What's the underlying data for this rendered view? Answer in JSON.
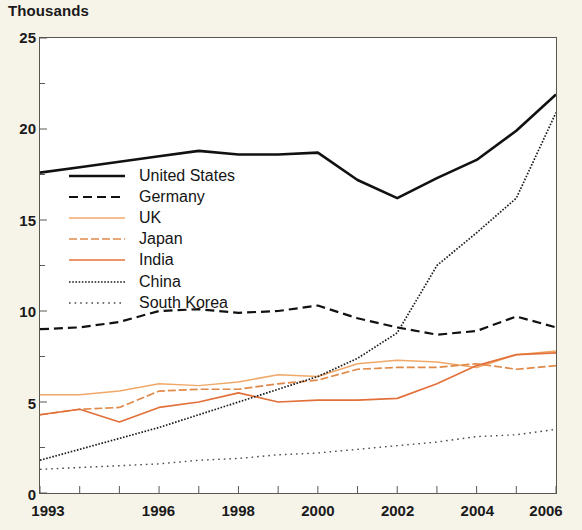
{
  "figure": {
    "unit_label": "Thousands",
    "background_color": "#f6f3e9",
    "plot_background_color": "#ffffff",
    "axis_color": "#58564e"
  },
  "legend": {
    "position": "inside-upper-left",
    "entries": [
      {
        "label": "United States",
        "color": "#111111",
        "style": "solid",
        "width": 2.6
      },
      {
        "label": "Germany",
        "color": "#111111",
        "style": "dashed",
        "width": 2.2
      },
      {
        "label": "UK",
        "color": "#f0a868",
        "style": "solid",
        "width": 1.5
      },
      {
        "label": "Japan",
        "color": "#e08a4a",
        "style": "dashdot",
        "width": 1.7
      },
      {
        "label": "India",
        "color": "#e2703a",
        "style": "solid",
        "width": 1.7
      },
      {
        "label": "China",
        "color": "#1c1c1c",
        "style": "dotted-fine",
        "width": 1.7
      },
      {
        "label": "South Korea",
        "color": "#4a4a4a",
        "style": "dotted-sparse",
        "width": 1.4
      }
    ]
  },
  "chart_data": {
    "type": "line",
    "title": "",
    "subtitle": "",
    "xlabel": "",
    "ylabel": "Thousands",
    "xlim": [
      1993,
      2006
    ],
    "ylim": [
      0,
      25
    ],
    "grid": false,
    "x": [
      1993,
      1994,
      1995,
      1996,
      1997,
      1998,
      1999,
      2000,
      2001,
      2002,
      2003,
      2004,
      2005,
      2006
    ],
    "x_tick_labels": [
      "1993",
      "1996",
      "1998",
      "2000",
      "2002",
      "2004",
      "2006"
    ],
    "x_tick_values": [
      1993,
      1996,
      1998,
      2000,
      2002,
      2004,
      2006
    ],
    "y_tick_labels": [
      "0",
      "5",
      "10",
      "15",
      "20",
      "25"
    ],
    "y_tick_values": [
      0,
      5,
      10,
      15,
      20,
      25
    ],
    "y_minor_tick_values": [
      2.5,
      7.5,
      12.5,
      17.5,
      22.5
    ],
    "series": [
      {
        "name": "United States",
        "color": "#111111",
        "style": "solid",
        "width": 2.6,
        "values": [
          17.6,
          17.9,
          18.2,
          18.5,
          18.8,
          18.6,
          18.6,
          18.7,
          17.2,
          16.2,
          17.3,
          18.3,
          19.9,
          21.9
        ]
      },
      {
        "name": "Germany",
        "color": "#111111",
        "style": "dashed",
        "width": 2.2,
        "values": [
          9.0,
          9.1,
          9.4,
          10.0,
          10.1,
          9.9,
          10.0,
          10.3,
          9.6,
          9.1,
          8.7,
          8.9,
          9.7,
          9.1
        ]
      },
      {
        "name": "UK",
        "color": "#f0a868",
        "style": "solid",
        "width": 1.5,
        "values": [
          5.4,
          5.4,
          5.6,
          6.0,
          5.9,
          6.1,
          6.5,
          6.4,
          7.1,
          7.3,
          7.2,
          6.9,
          7.6,
          7.8
        ]
      },
      {
        "name": "Japan",
        "color": "#e08a4a",
        "style": "dashdot",
        "width": 1.7,
        "values": [
          4.3,
          4.6,
          4.7,
          5.6,
          5.7,
          5.7,
          6.0,
          6.2,
          6.8,
          6.9,
          6.9,
          7.1,
          6.8,
          7.0
        ]
      },
      {
        "name": "India",
        "color": "#e2703a",
        "style": "solid",
        "width": 1.7,
        "values": [
          4.3,
          4.6,
          3.9,
          4.7,
          5.0,
          5.5,
          5.0,
          5.1,
          5.1,
          5.2,
          6.0,
          7.0,
          7.6,
          7.7
        ]
      },
      {
        "name": "China",
        "color": "#1c1c1c",
        "style": "dotted-fine",
        "width": 1.7,
        "values": [
          1.8,
          2.4,
          3.0,
          3.6,
          4.3,
          5.0,
          5.7,
          6.4,
          7.4,
          8.8,
          12.5,
          14.3,
          16.2,
          20.9
        ]
      },
      {
        "name": "South Korea",
        "color": "#4a4a4a",
        "style": "dotted-sparse",
        "width": 1.4,
        "values": [
          1.3,
          1.4,
          1.5,
          1.6,
          1.8,
          1.9,
          2.1,
          2.2,
          2.4,
          2.6,
          2.8,
          3.1,
          3.2,
          3.5
        ]
      }
    ]
  }
}
